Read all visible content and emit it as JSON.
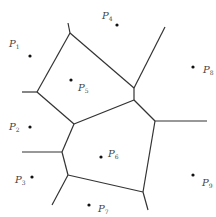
{
  "colors": {
    "edge": "#333333",
    "point": "#111111",
    "label": "#444444"
  },
  "points": [
    {
      "name": "P",
      "sub": "1",
      "x": 30,
      "y": 56,
      "lx": 9,
      "ly": 39
    },
    {
      "name": "P",
      "sub": "2",
      "x": 30,
      "y": 127,
      "lx": 9,
      "ly": 122
    },
    {
      "name": "P",
      "sub": "3",
      "x": 32,
      "y": 177,
      "lx": 15,
      "ly": 175
    },
    {
      "name": "P",
      "sub": "4",
      "x": 117,
      "y": 25,
      "lx": 102,
      "ly": 11
    },
    {
      "name": "P",
      "sub": "5",
      "x": 71,
      "y": 80,
      "lx": 78,
      "ly": 83
    },
    {
      "name": "P",
      "sub": "6",
      "x": 101,
      "y": 157,
      "lx": 108,
      "ly": 149
    },
    {
      "name": "P",
      "sub": "7",
      "x": 89,
      "y": 205,
      "lx": 98,
      "ly": 204
    },
    {
      "name": "P",
      "sub": "8",
      "x": 193,
      "y": 67,
      "lx": 203,
      "ly": 65
    },
    {
      "name": "P",
      "sub": "9",
      "x": 193,
      "y": 175,
      "lx": 202,
      "ly": 178
    }
  ],
  "edges": [
    [
      68,
      23,
      70,
      33
    ],
    [
      70,
      33,
      134,
      88
    ],
    [
      70,
      33,
      37,
      92
    ],
    [
      37,
      92,
      22,
      92
    ],
    [
      37,
      92,
      74,
      124
    ],
    [
      74,
      124,
      134,
      100
    ],
    [
      134,
      100,
      134,
      88
    ],
    [
      134,
      88,
      165,
      27
    ],
    [
      134,
      100,
      155,
      121
    ],
    [
      155,
      121,
      207,
      121
    ],
    [
      74,
      124,
      62,
      152
    ],
    [
      62,
      152,
      22,
      152
    ],
    [
      62,
      152,
      68,
      175
    ],
    [
      68,
      175,
      52,
      205
    ],
    [
      68,
      175,
      143,
      192
    ],
    [
      143,
      192,
      155,
      121
    ],
    [
      143,
      192,
      148,
      210
    ]
  ]
}
